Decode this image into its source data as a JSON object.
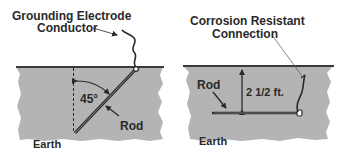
{
  "left_panel": {
    "title_line1": "Grounding Electrode",
    "title_line2": "Conductor",
    "angle_label": "45°",
    "rod_label": "Rod",
    "earth_label": "Earth"
  },
  "right_panel": {
    "title_line1": "Corrosion Resistant",
    "title_line2": "Connection",
    "depth_label": "2 1/2 ft.",
    "rod_label": "Rod",
    "earth_label": "Earth"
  },
  "colors": {
    "earth": "#b4b4b4",
    "ground_line": "#3a3a3a",
    "text": "#2a2a2a",
    "rod": "#2c2c2c"
  }
}
